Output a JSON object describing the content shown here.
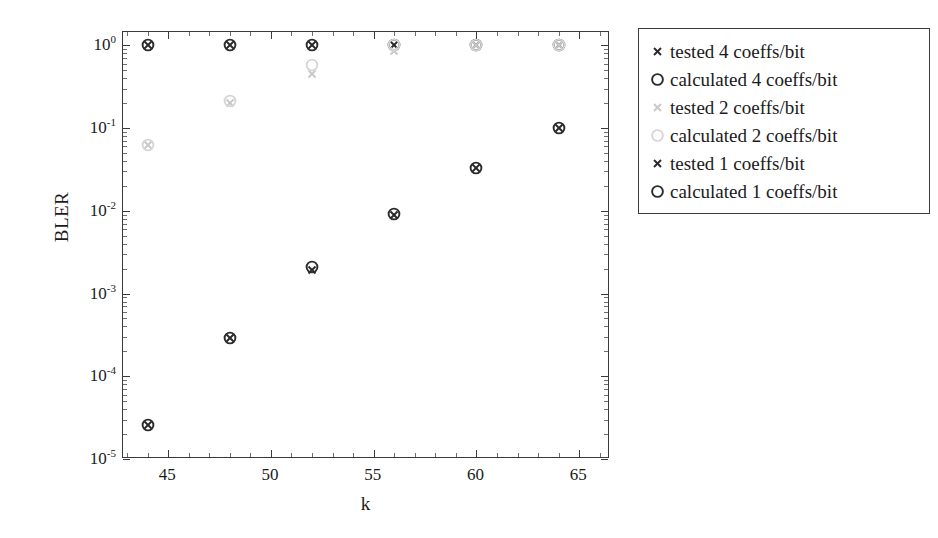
{
  "chart_data": {
    "type": "scatter",
    "title": "",
    "xlabel": "k",
    "ylabel": "BLER",
    "xlim": [
      42.8,
      66.5
    ],
    "ylim": [
      1e-05,
      1.45
    ],
    "yscale": "log",
    "xscale": "linear",
    "grid": false,
    "legend_position": "outside-right-top",
    "x_ticks": [
      "45",
      "50",
      "55",
      "60",
      "65"
    ],
    "x_tick_values": [
      45,
      50,
      55,
      60,
      65
    ],
    "y_ticks": [
      "10^0",
      "10^-1",
      "10^-2",
      "10^-3",
      "10^-4",
      "10^-5"
    ],
    "y_tick_values": [
      1,
      0.1,
      0.01,
      0.001,
      0.0001,
      1e-05
    ],
    "y_tick_mantissa": "10",
    "y_tick_exponents": [
      "0",
      "-1",
      "-2",
      "-3",
      "-4",
      "-5"
    ],
    "x": [
      44,
      48,
      52,
      56,
      60,
      64
    ],
    "series": [
      {
        "name": "tested 4 coeffs/bit",
        "marker": "x",
        "color": "#2b2b2b",
        "values": [
          1.0,
          1.0,
          1.0,
          1.0,
          1.0,
          1.0
        ]
      },
      {
        "name": "calculated 4 coeffs/bit",
        "marker": "o",
        "color": "#2b2b2b",
        "values": [
          1.0,
          1.0,
          1.0,
          1.0,
          1.0,
          1.0
        ]
      },
      {
        "name": "tested 2 coeffs/bit",
        "marker": "x",
        "color": "#c9c9c9",
        "values": [
          0.062,
          0.2,
          0.45,
          0.85,
          1.0,
          1.0
        ]
      },
      {
        "name": "calculated 2 coeffs/bit",
        "marker": "o",
        "color": "#d6d6d6",
        "values": [
          0.062,
          0.21,
          0.58,
          1.0,
          1.0,
          1.0
        ]
      },
      {
        "name": "tested 1 coeffs/bit",
        "marker": "x",
        "color": "#2b2b2b",
        "values": [
          2.6e-05,
          0.00029,
          0.00195,
          0.009,
          0.033,
          0.1
        ]
      },
      {
        "name": "calculated 1 coeffs/bit",
        "marker": "o",
        "color": "#2b2b2b",
        "values": [
          2.6e-05,
          0.00029,
          0.0021,
          0.0092,
          0.033,
          0.1
        ]
      }
    ]
  },
  "axes": {
    "y_title": "BLER",
    "x_title": "k"
  },
  "legend": {
    "items": [
      {
        "marker": "x-marker-icon",
        "label": "tested 4 coeffs/bit",
        "color": "#2b2b2b"
      },
      {
        "marker": "circle-marker-icon",
        "label": "calculated 4 coeffs/bit",
        "color": "#2b2b2b"
      },
      {
        "marker": "x-marker-icon",
        "label": "tested 2 coeffs/bit",
        "color": "#c9c9c9"
      },
      {
        "marker": "circle-marker-icon",
        "label": "calculated 2 coeffs/bit",
        "color": "#d6d6d6"
      },
      {
        "marker": "x-marker-icon",
        "label": "tested 1 coeffs/bit",
        "color": "#2b2b2b"
      },
      {
        "marker": "circle-marker-icon",
        "label": "calculated 1 coeffs/bit",
        "color": "#2b2b2b"
      }
    ]
  }
}
